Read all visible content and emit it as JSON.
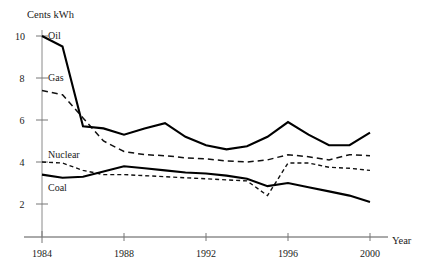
{
  "chart_data": {
    "type": "line",
    "title": "",
    "xlabel": "Year",
    "ylabel": "Cents kWh",
    "xlim": [
      1984,
      2000
    ],
    "ylim": [
      0,
      10.6
    ],
    "grid": false,
    "legend_position": "inline-labels",
    "x": [
      1984,
      1985,
      1986,
      1987,
      1988,
      1989,
      1990,
      1991,
      1992,
      1993,
      1994,
      1995,
      1996,
      1997,
      1998,
      1999,
      2000
    ],
    "xticks": [
      1984,
      1988,
      1992,
      1996,
      2000
    ],
    "xtick_labels": [
      "1984",
      "1988",
      "1992",
      "1996",
      "2000"
    ],
    "yticks": [
      2,
      4,
      6,
      8,
      10
    ],
    "ytick_labels": [
      "2",
      "4",
      "6",
      "8",
      "10"
    ],
    "series": [
      {
        "name": "Oil",
        "style": "solid",
        "linewidth": "thick",
        "values": [
          10.0,
          9.5,
          5.7,
          5.6,
          5.3,
          5.6,
          5.85,
          5.2,
          4.8,
          4.6,
          4.75,
          5.2,
          5.9,
          5.3,
          4.8,
          4.8,
          5.4
        ]
      },
      {
        "name": "Gas",
        "style": "dashed",
        "linewidth": "thin",
        "values": [
          7.4,
          7.2,
          6.1,
          5.0,
          4.5,
          4.35,
          4.3,
          4.2,
          4.15,
          4.05,
          4.0,
          4.1,
          4.35,
          4.25,
          4.1,
          4.35,
          4.3
        ]
      },
      {
        "name": "Nuclear",
        "style": "dashed",
        "linewidth": "thin",
        "values": [
          4.0,
          3.95,
          3.6,
          3.4,
          3.4,
          3.35,
          3.3,
          3.25,
          3.2,
          3.15,
          3.1,
          2.4,
          3.95,
          3.95,
          3.75,
          3.7,
          3.6
        ]
      },
      {
        "name": "Coal",
        "style": "solid",
        "linewidth": "thick",
        "values": [
          3.4,
          3.25,
          3.3,
          3.55,
          3.8,
          3.7,
          3.6,
          3.5,
          3.45,
          3.35,
          3.2,
          2.85,
          3.0,
          2.8,
          2.6,
          2.4,
          2.1
        ]
      }
    ],
    "annotations": [
      {
        "name": "Oil",
        "x": 1984.3,
        "y": 10.35
      },
      {
        "name": "Gas",
        "x": 1984.3,
        "y": 8.2
      },
      {
        "name": "Nuclear",
        "x": 1984.3,
        "y": 4.45
      },
      {
        "name": "Coal",
        "x": 1984.3,
        "y": 2.7
      }
    ]
  }
}
